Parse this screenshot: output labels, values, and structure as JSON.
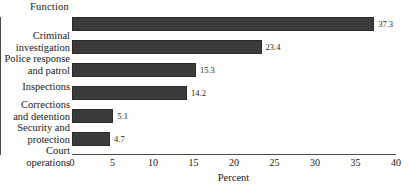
{
  "chart_data": {
    "type": "bar",
    "orientation": "horizontal",
    "title": "",
    "category_axis_title": "Function",
    "xlabel": "Percent",
    "ylabel": "",
    "xlim": [
      0,
      40
    ],
    "xticks": [
      0,
      5,
      10,
      15,
      20,
      25,
      30,
      35,
      40
    ],
    "xtick_labels": [
      "0",
      "5",
      "10",
      "15",
      "20",
      "25",
      "30",
      "35",
      "40"
    ],
    "grid": false,
    "legend": false,
    "categories": [
      "Criminal\ninvestigation",
      "Police response\nand patrol",
      "Inspections",
      "Corrections\nand detention",
      "Security and\nprotection",
      "Court\noperations"
    ],
    "values": [
      37.3,
      23.4,
      15.3,
      14.2,
      5.1,
      4.7
    ],
    "value_labels": [
      "37.3",
      "23.4",
      "15.3",
      "14.2",
      "5.1",
      "4.7"
    ],
    "bar_color": "#3b3b3b",
    "bar_edge_color": "#2a2a2a",
    "axis_color": "#4a4a4a",
    "background_color": "#fdfdfb"
  }
}
